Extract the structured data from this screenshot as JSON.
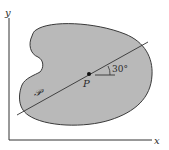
{
  "diagram": {
    "axes": {
      "x_label": "x",
      "y_label": "y"
    },
    "region_label": "𝒫",
    "point_label": "P",
    "angle_label": "30°",
    "line_angle_degrees": 30,
    "colors": {
      "region_fill": "#b9b9b9",
      "stroke": "#333333",
      "background": "#ffffff"
    }
  }
}
